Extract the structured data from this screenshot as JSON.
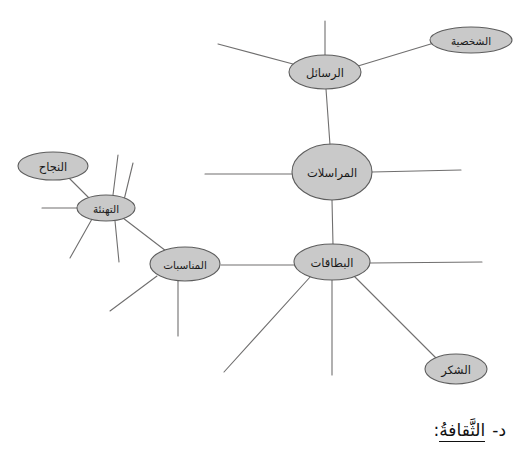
{
  "diagram": {
    "type": "mind-map",
    "title_node": "المراسلات",
    "nodes": [
      {
        "id": "murasalat",
        "label": "المراسلات",
        "cx": 332,
        "cy": 172,
        "rx": 40,
        "ry": 28,
        "size": "large"
      },
      {
        "id": "rasail",
        "label": "الرسائل",
        "cx": 325,
        "cy": 72,
        "rx": 36,
        "ry": 17,
        "size": "normal"
      },
      {
        "id": "shakhsiyya",
        "label": "الشخصية",
        "cx": 471,
        "cy": 40,
        "rx": 41,
        "ry": 13,
        "size": "small"
      },
      {
        "id": "bitaqat",
        "label": "البطاقات",
        "cx": 332,
        "cy": 262,
        "rx": 38,
        "ry": 18,
        "size": "normal"
      },
      {
        "id": "shukr",
        "label": "الشكر",
        "cx": 456,
        "cy": 369,
        "rx": 31,
        "ry": 15,
        "size": "normal"
      },
      {
        "id": "munasabat",
        "label": "المناسبات",
        "cx": 185,
        "cy": 264,
        "rx": 35,
        "ry": 17,
        "size": "normal"
      },
      {
        "id": "tahni2a",
        "label": "التهنئة",
        "cx": 106,
        "cy": 208,
        "rx": 29,
        "ry": 13,
        "size": "normal"
      },
      {
        "id": "najah",
        "label": "النجاح",
        "cx": 53,
        "cy": 166,
        "rx": 35,
        "ry": 14,
        "size": "normal"
      }
    ],
    "edges": [
      {
        "from": "rasail",
        "to": "shakhsiyya",
        "kind": "node-link"
      },
      {
        "from": "rasail",
        "to": "murasalat",
        "kind": "node-link"
      },
      {
        "from": "murasalat",
        "to": "bitaqat",
        "kind": "node-link"
      },
      {
        "from": "bitaqat",
        "to": "munasabat",
        "kind": "node-link"
      },
      {
        "from": "bitaqat",
        "to": "shukr",
        "kind": "node-link"
      },
      {
        "from": "munasabat",
        "to": "tahni2a",
        "kind": "node-link"
      },
      {
        "from": "tahni2a",
        "to": "najah",
        "kind": "node-link"
      },
      {
        "from": "rasail",
        "to": null,
        "kind": "blank-branch",
        "note": "up stub"
      },
      {
        "from": "rasail",
        "to": null,
        "kind": "blank-branch",
        "note": "upper-left diagonal"
      },
      {
        "from": "murasalat",
        "to": null,
        "kind": "blank-branch",
        "note": "left horizontal"
      },
      {
        "from": "murasalat",
        "to": null,
        "kind": "blank-branch",
        "note": "right horizontal"
      },
      {
        "from": "bitaqat",
        "to": null,
        "kind": "blank-branch",
        "note": "right horizontal"
      },
      {
        "from": "bitaqat",
        "to": null,
        "kind": "blank-branch",
        "note": "down vertical"
      },
      {
        "from": "bitaqat",
        "to": null,
        "kind": "blank-branch",
        "note": "down-left diagonal"
      },
      {
        "from": "munasabat",
        "to": null,
        "kind": "blank-branch",
        "note": "down vertical"
      },
      {
        "from": "munasabat",
        "to": null,
        "kind": "blank-branch",
        "note": "down-left diagonal"
      },
      {
        "from": "tahni2a",
        "to": null,
        "kind": "blank-branch",
        "note": "left horizontal"
      },
      {
        "from": "tahni2a",
        "to": null,
        "kind": "blank-branch",
        "note": "up vertical"
      },
      {
        "from": "tahni2a",
        "to": null,
        "kind": "blank-branch",
        "note": "up-right diagonal"
      },
      {
        "from": "tahni2a",
        "to": null,
        "kind": "blank-branch",
        "note": "down-left diagonal"
      },
      {
        "from": "tahni2a",
        "to": null,
        "kind": "blank-branch",
        "note": "down vertical"
      }
    ],
    "colors": {
      "node_fill": "#c9c9c9",
      "node_stroke": "#5d5d5d",
      "edge_stroke": "#706f6f",
      "text": "#1a1a1a",
      "background": "#ffffff"
    }
  },
  "caption": {
    "marker": "د-",
    "term": "الثَّقافةُ",
    "colon": ":"
  },
  "labels": {
    "murasalat": "المراسلات",
    "rasail": "الرسائل",
    "shakhsiyya": "الشخصية",
    "bitaqat": "البطاقات",
    "shukr": "الشكر",
    "munasabat": "المناسبات",
    "tahni2a": "التهنئة",
    "najah": "النجاح"
  }
}
